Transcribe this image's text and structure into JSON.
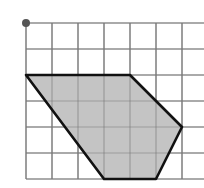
{
  "diagram": {
    "type": "grid-polygon",
    "grid": {
      "origin_px": [
        26,
        23
      ],
      "cell_px": 26,
      "columns": 7,
      "rows": 6,
      "extend_right_px": 204,
      "line_color": "#7a7a7a",
      "line_width": 1.2
    },
    "origin_dot": {
      "grid": [
        0,
        0
      ],
      "radius": 4,
      "color": "#555555"
    },
    "polygon": {
      "vertices_grid": [
        [
          0,
          2
        ],
        [
          4,
          2
        ],
        [
          6,
          4
        ],
        [
          5,
          6
        ],
        [
          3,
          6
        ]
      ],
      "fill": "#c4c4c4",
      "stroke": "#111111",
      "stroke_width": 2.6
    }
  }
}
